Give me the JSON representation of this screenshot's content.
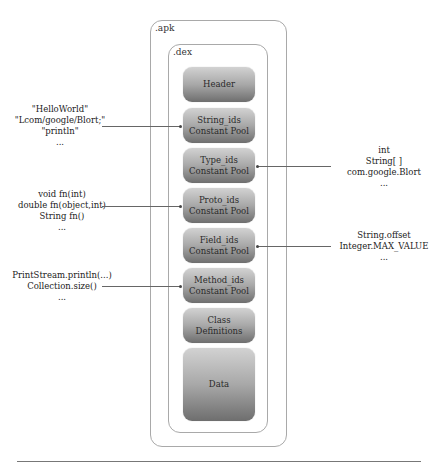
{
  "diagram": {
    "apk_label": ".apk",
    "dex_label": ".dex",
    "blocks": [
      {
        "line1": "Header",
        "line2": ""
      },
      {
        "line1": "String_ids",
        "line2": "Constant Pool"
      },
      {
        "line1": "Type_ids",
        "line2": "Constant Pool"
      },
      {
        "line1": "Proto_ids",
        "line2": "Constant Pool"
      },
      {
        "line1": "Field_ids",
        "line2": "Constant Pool"
      },
      {
        "line1": "Method_ids",
        "line2": "Constant Pool"
      },
      {
        "line1": "Class",
        "line2": "Definitions"
      },
      {
        "line1": "Data",
        "line2": ""
      }
    ],
    "annotations": {
      "strings": [
        "\"HelloWorld\"",
        "\"Lcom/google/Blort;\"",
        "\"println\"",
        "..."
      ],
      "types": [
        "int",
        "String[ ]",
        "com.google.Blort",
        "..."
      ],
      "protos": [
        "void fn(int)",
        "double fn(object,int)",
        "String fn()",
        "..."
      ],
      "fields": [
        "String.offset",
        "Integer.MAX_VALUE",
        "..."
      ],
      "methods": [
        "PrintStream.println(...)",
        "Collection.size()",
        "..."
      ]
    },
    "colors": {
      "block_top": "#d2d2d2",
      "block_bottom": "#6e6e6e",
      "border": "#a9a9a9",
      "arrow": "#666666"
    }
  }
}
